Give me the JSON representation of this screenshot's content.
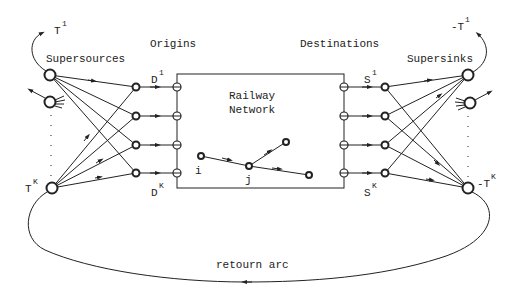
{
  "diagram": {
    "labels": {
      "supersources": "Supersources",
      "origins": "Origins",
      "destinations": "Destinations",
      "supersinks": "Supersinks",
      "network_line1": "Railway",
      "network_line2": "Network",
      "return_arc": "retourn arc",
      "node_i": "i",
      "node_j": "j"
    },
    "symbols": {
      "T1_base": "T",
      "T1_sup": "1",
      "TK_base": "T",
      "TK_sup": "K",
      "D1_base": "D",
      "D1_sup": "1",
      "DK_base": "D",
      "DK_sup": "K",
      "S1_base": "S",
      "S1_sup": "1",
      "SK_base": "S",
      "SK_sup": "K",
      "negT1_base": "-T",
      "negT1_sup": "1",
      "negTK_base": "-T",
      "negTK_sup": "K"
    },
    "colors": {
      "ink": "#222222",
      "background": "#ffffff"
    }
  }
}
